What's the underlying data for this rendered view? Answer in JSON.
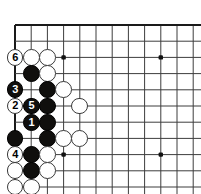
{
  "figure": {
    "kind": "go-board-diagram",
    "width": 201,
    "height": 194
  },
  "board": {
    "columns": 12,
    "rows": 11,
    "origin_x": 15,
    "origin_y": 25,
    "spacing": 16.2,
    "line_color": "#3d3d3d",
    "edge_color": "#1a1a1a",
    "background_color": "#ffffff",
    "stone_radius": 8.4,
    "star_point_color": "#111111",
    "star_points": [
      {
        "col": 4,
        "row": 3
      },
      {
        "col": 10,
        "row": 3
      },
      {
        "col": 4,
        "row": 9
      },
      {
        "col": 10,
        "row": 9
      }
    ]
  },
  "colors": {
    "black_stone": "#100f0d",
    "white_stone": "#ffffff",
    "white_stone_border": "#3a3a3a",
    "black_number": "#ffffff",
    "white_number": "#000000"
  },
  "stones": [
    {
      "col": 1,
      "row": 3,
      "color": "white",
      "label": "6"
    },
    {
      "col": 2,
      "row": 3,
      "color": "white",
      "label": ""
    },
    {
      "col": 3,
      "row": 3,
      "color": "white",
      "label": ""
    },
    {
      "col": 2,
      "row": 4,
      "color": "black",
      "label": ""
    },
    {
      "col": 3,
      "row": 4,
      "color": "white",
      "label": ""
    },
    {
      "col": 1,
      "row": 5,
      "color": "black",
      "label": "3"
    },
    {
      "col": 3,
      "row": 5,
      "color": "black",
      "label": ""
    },
    {
      "col": 4,
      "row": 5,
      "color": "white",
      "label": ""
    },
    {
      "col": 1,
      "row": 6,
      "color": "white",
      "label": "2"
    },
    {
      "col": 2,
      "row": 6,
      "color": "black",
      "label": "5"
    },
    {
      "col": 3,
      "row": 6,
      "color": "black",
      "label": ""
    },
    {
      "col": 5,
      "row": 6,
      "color": "white",
      "label": ""
    },
    {
      "col": 2,
      "row": 7,
      "color": "black",
      "label": "1"
    },
    {
      "col": 3,
      "row": 7,
      "color": "black",
      "label": ""
    },
    {
      "col": 1,
      "row": 8,
      "color": "black",
      "label": ""
    },
    {
      "col": 3,
      "row": 8,
      "color": "black",
      "label": ""
    },
    {
      "col": 4,
      "row": 8,
      "color": "white",
      "label": ""
    },
    {
      "col": 5,
      "row": 8,
      "color": "white",
      "label": ""
    },
    {
      "col": 1,
      "row": 9,
      "color": "white",
      "label": "4"
    },
    {
      "col": 2,
      "row": 9,
      "color": "black",
      "label": ""
    },
    {
      "col": 3,
      "row": 9,
      "color": "white",
      "label": ""
    },
    {
      "col": 1,
      "row": 10,
      "color": "white",
      "label": ""
    },
    {
      "col": 2,
      "row": 10,
      "color": "black",
      "label": ""
    },
    {
      "col": 3,
      "row": 10,
      "color": "white",
      "label": ""
    },
    {
      "col": 1,
      "row": 11,
      "color": "white",
      "label": ""
    },
    {
      "col": 2,
      "row": 11,
      "color": "white",
      "label": ""
    },
    {
      "col": 3,
      "row": 12,
      "color": "white",
      "label": ""
    }
  ],
  "move_numbers": {
    "1": {
      "color": "black",
      "col": 2,
      "row": 7
    },
    "2": {
      "color": "white",
      "col": 1,
      "row": 6
    },
    "3": {
      "color": "black",
      "col": 1,
      "row": 5
    },
    "4": {
      "color": "white",
      "col": 1,
      "row": 9
    },
    "5": {
      "color": "black",
      "col": 2,
      "row": 6
    },
    "6": {
      "color": "white",
      "col": 1,
      "row": 3
    }
  }
}
